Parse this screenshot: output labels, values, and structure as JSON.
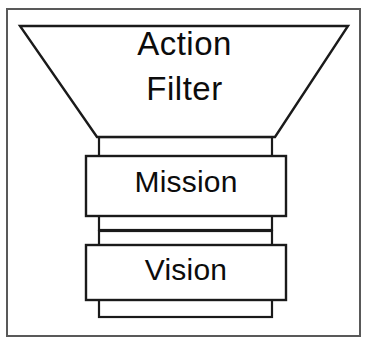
{
  "diagram": {
    "canvas": {
      "width": 369,
      "height": 345,
      "background": "#ffffff"
    },
    "style": {
      "stroke_color": "#1a1a1a",
      "fill_color": "#ffffff",
      "frame_stroke_color": "#595959",
      "stroke_width_shape": 2.2,
      "stroke_width_frame": 2.0
    },
    "frame": {
      "x": 6,
      "y": 8,
      "width": 355,
      "height": 329
    },
    "funnel": {
      "label_line_1": "Action",
      "label_line_2": "Filter",
      "top_left_x": 20,
      "top_right_x": 348,
      "top_y": 26,
      "bottom_left_x": 97,
      "bottom_right_x": 275,
      "bottom_y": 137,
      "points": "20,26 348,26 275,137 97,137"
    },
    "necks": [
      {
        "name": "neck-upper",
        "x": 99,
        "y": 137,
        "width": 173,
        "height": 20
      },
      {
        "name": "neck-middle",
        "x": 99,
        "y": 215,
        "width": 173,
        "height": 28
      },
      {
        "name": "neck-lower",
        "x": 99,
        "y": 299,
        "width": 173,
        "height": 18
      }
    ],
    "boxes": [
      {
        "name": "mission-box",
        "label": "Mission",
        "x": 86,
        "y": 156,
        "width": 200,
        "height": 60
      },
      {
        "name": "vision-box",
        "label": "Vision",
        "x": 86,
        "y": 245,
        "width": 200,
        "height": 55
      }
    ],
    "divider": {
      "name": "neck-middle-divider",
      "x1": 99,
      "y1": 229,
      "x2": 272,
      "y2": 229
    }
  }
}
